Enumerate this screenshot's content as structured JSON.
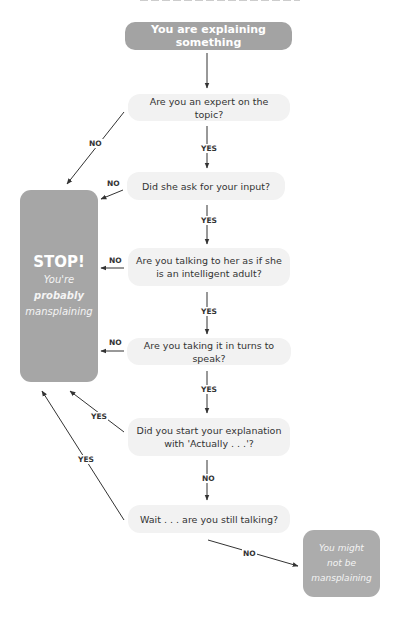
{
  "diagram": {
    "type": "flowchart",
    "colors": {
      "start_fill": "#a3a3a3",
      "question_fill": "#f2f2f2",
      "terminal_fill": "#a6a6a6",
      "text_dark": "#333333",
      "text_light": "#ffffff",
      "arrow": "#333333"
    },
    "start": {
      "label": "You are explaining something"
    },
    "questions": [
      {
        "id": "q1",
        "line1": "Are you an expert on the topic?",
        "line2": ""
      },
      {
        "id": "q2",
        "line1": "Did she ask for your input?",
        "line2": ""
      },
      {
        "id": "q3",
        "line1": "Are you talking to her as if she",
        "line2": "is an intelligent adult?"
      },
      {
        "id": "q4",
        "line1": "Are you taking it in turns to speak?",
        "line2": ""
      },
      {
        "id": "q5",
        "line1": "Did you start your explanation",
        "line2": "with 'Actually . . .'?"
      },
      {
        "id": "q6",
        "line1": "Wait . . . are you still talking?",
        "line2": ""
      }
    ],
    "stop": {
      "title": "STOP!",
      "line1": "You're",
      "line2": "probably",
      "line3": "mansplaining"
    },
    "end": {
      "line1": "You might",
      "line2": "not be",
      "line3": "mansplaining"
    },
    "edge_labels": {
      "q1_no": "NO",
      "q1_yes": "YES",
      "q2_no": "NO",
      "q2_yes": "YES",
      "q3_no": "NO",
      "q3_yes": "YES",
      "q4_no": "NO",
      "q4_yes": "YES",
      "q5_yes": "YES",
      "q5_no": "NO",
      "q6_yes": "YES",
      "q6_no": "NO"
    },
    "edges": [
      {
        "from": "start",
        "to": "q1",
        "label": ""
      },
      {
        "from": "q1",
        "to": "stop",
        "label": "NO"
      },
      {
        "from": "q1",
        "to": "q2",
        "label": "YES"
      },
      {
        "from": "q2",
        "to": "stop",
        "label": "NO"
      },
      {
        "from": "q2",
        "to": "q3",
        "label": "YES"
      },
      {
        "from": "q3",
        "to": "stop",
        "label": "NO"
      },
      {
        "from": "q3",
        "to": "q4",
        "label": "YES"
      },
      {
        "from": "q4",
        "to": "stop",
        "label": "NO"
      },
      {
        "from": "q4",
        "to": "q5",
        "label": "YES"
      },
      {
        "from": "q5",
        "to": "stop",
        "label": "YES"
      },
      {
        "from": "q5",
        "to": "q6",
        "label": "NO"
      },
      {
        "from": "q6",
        "to": "stop",
        "label": "YES"
      },
      {
        "from": "q6",
        "to": "end",
        "label": "NO"
      }
    ]
  }
}
